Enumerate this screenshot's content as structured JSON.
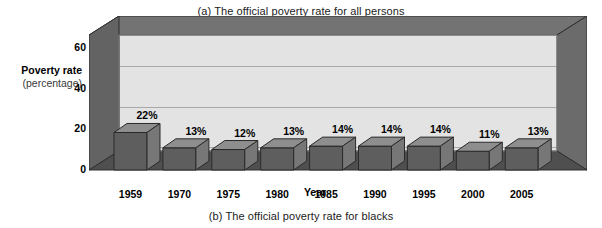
{
  "captions": {
    "top": "(a) The official poverty rate for all persons",
    "bottom": "(b) The official poverty rate for blacks"
  },
  "axes": {
    "y_title": "Poverty rate",
    "y_subtitle": "(percentage)",
    "x_title": "Year"
  },
  "colors": {
    "bar_front": "#5e5e5e",
    "bar_top": "#8e8e8e",
    "bar_side": "#777777",
    "bar_outline": "#2a2a2a",
    "back_panel": "#e3e3e3",
    "wall": "#737373",
    "wall_dark": "#636363",
    "floor": "#4f4f4f",
    "gridline": "#a8a8a8",
    "text": "#000000",
    "background": "#ffffff"
  },
  "chart_data": {
    "type": "bar",
    "title": "(a) The official poverty rate for all persons",
    "subtitle": "(b) The official poverty rate for blacks",
    "xlabel": "Year",
    "ylabel": "Poverty rate (percentage)",
    "categories": [
      "1959",
      "1970",
      "1975",
      "1980",
      "1985",
      "1990",
      "1995",
      "2000",
      "2005"
    ],
    "values": [
      22,
      13,
      12,
      13,
      14,
      14,
      14,
      11,
      13
    ],
    "data_labels": [
      "22%",
      "13%",
      "12%",
      "13%",
      "14%",
      "14%",
      "14%",
      "11%",
      "13%"
    ],
    "yticks": [
      0,
      20,
      40,
      60
    ],
    "ytick_labels": [
      "0",
      "20",
      "40",
      "60"
    ],
    "ylim": [
      0,
      68
    ],
    "grid": true,
    "legend": "none",
    "style": "3d-column"
  }
}
